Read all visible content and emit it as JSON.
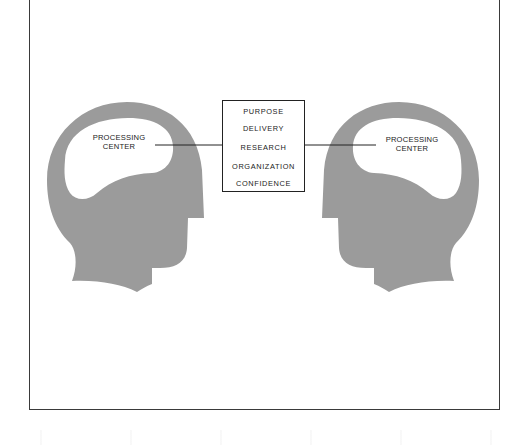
{
  "diagram": {
    "type": "communication-model",
    "left_head": {
      "label_line1": "PROCESSING",
      "label_line2": "CENTER"
    },
    "right_head": {
      "label_line1": "PROCESSING",
      "label_line2": "CENTER"
    },
    "center_box": {
      "items": [
        "PURPOSE",
        "DELIVERY",
        "RESEARCH",
        "ORGANIZATION",
        "CONFIDENCE"
      ]
    },
    "colors": {
      "head": "#9b9b9b",
      "brain": "#ffffff",
      "line": "#222222",
      "frame": "#3a3a3a"
    }
  }
}
